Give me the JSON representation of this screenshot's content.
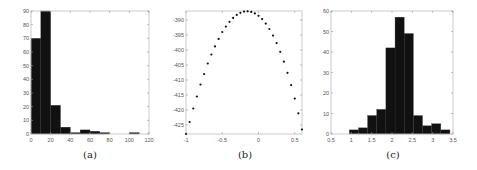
{
  "figure": {
    "captions": [
      "(a)",
      "(b)",
      "(c)"
    ]
  },
  "chart_data": [
    {
      "id": "a",
      "type": "bar",
      "subtype": "histogram",
      "title": "",
      "caption": "(a)",
      "xlabel": "",
      "ylabel": "",
      "bin_edges": [
        0,
        10,
        20,
        30,
        40,
        50,
        60,
        70,
        80,
        90,
        100,
        110,
        120
      ],
      "values": [
        70,
        90,
        21,
        5,
        1,
        3,
        2,
        1,
        0,
        0,
        1,
        0
      ],
      "xlim": [
        0,
        120
      ],
      "ylim": [
        0,
        90
      ],
      "xticks": [
        0,
        20,
        40,
        60,
        80,
        100,
        120
      ],
      "yticks": [
        0,
        10,
        20,
        30,
        40,
        50,
        60,
        70,
        80,
        90
      ],
      "bar_color": "#111111",
      "grid": false,
      "legend": null
    },
    {
      "id": "b",
      "type": "scatter",
      "title": "",
      "caption": "(b)",
      "xlabel": "",
      "ylabel": "",
      "x": [
        -1.0,
        -0.95,
        -0.9,
        -0.85,
        -0.8,
        -0.75,
        -0.7,
        -0.65,
        -0.6,
        -0.55,
        -0.5,
        -0.45,
        -0.4,
        -0.35,
        -0.3,
        -0.25,
        -0.2,
        -0.15,
        -0.1,
        -0.05,
        0.0,
        0.05,
        0.1,
        0.15,
        0.2,
        0.25,
        0.3,
        0.35,
        0.4,
        0.45,
        0.5,
        0.55,
        0.6
      ],
      "y": [
        -428.0,
        -424.0,
        -419.5,
        -415.5,
        -411.5,
        -408.0,
        -404.5,
        -401.5,
        -398.8,
        -396.3,
        -394.0,
        -392.2,
        -390.6,
        -389.3,
        -388.3,
        -387.6,
        -387.2,
        -387.1,
        -387.3,
        -387.8,
        -388.6,
        -389.7,
        -391.2,
        -393.0,
        -395.2,
        -397.7,
        -400.6,
        -403.9,
        -407.6,
        -411.7,
        -416.2,
        -421.1,
        -426.5
      ],
      "xlim": [
        -1,
        0.6
      ],
      "ylim": [
        -428,
        -387
      ],
      "xticks": [
        -1,
        -0.5,
        0,
        0.5
      ],
      "yticks": [
        -390,
        -395,
        -400,
        -405,
        -410,
        -415,
        -420,
        -425
      ],
      "marker_color": "#111111",
      "grid": false,
      "legend": null
    },
    {
      "id": "c",
      "type": "bar",
      "subtype": "histogram",
      "title": "",
      "caption": "(c)",
      "xlabel": "",
      "ylabel": "",
      "bin_edges": [
        0.95,
        1.175,
        1.4,
        1.625,
        1.85,
        2.075,
        2.3,
        2.525,
        2.75,
        2.975,
        3.2,
        3.425
      ],
      "values": [
        2,
        3,
        9,
        12,
        42,
        57,
        49,
        9,
        4,
        5,
        2
      ],
      "xlim": [
        0.5,
        3.5
      ],
      "ylim": [
        0,
        60
      ],
      "xticks": [
        0.5,
        1,
        1.5,
        2,
        2.5,
        3,
        3.5
      ],
      "yticks": [
        0,
        10,
        20,
        30,
        40,
        50,
        60
      ],
      "bar_color": "#111111",
      "grid": false,
      "legend": null
    }
  ]
}
